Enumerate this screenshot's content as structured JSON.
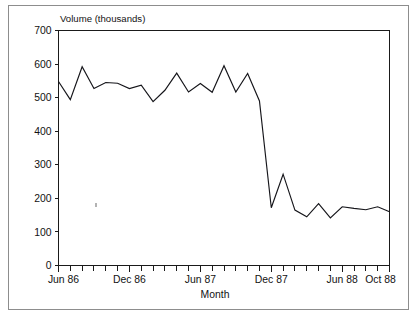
{
  "figure": {
    "background_color": "#ffffff",
    "border_color": "#8d8d8d",
    "line_color": "#15151a"
  },
  "chart_data": {
    "type": "line",
    "title": "",
    "subtitle": "",
    "ylabel": "Volume (thousands)",
    "xlabel": "Month",
    "ylim": [
      0,
      700
    ],
    "ytick_values": [
      0,
      100,
      200,
      300,
      400,
      500,
      600,
      700
    ],
    "ytick_labels": [
      "0",
      "100",
      "200",
      "300",
      "400",
      "500",
      "600",
      "700"
    ],
    "xtick_labels": [
      "Jun 86",
      "Dec 86",
      "Jun 87",
      "Dec 87",
      "Jun 88",
      "Oct 88"
    ],
    "xtick_indices": [
      0,
      6,
      12,
      18,
      24,
      28
    ],
    "grid": false,
    "legend": false,
    "minor_ticks": "monthly",
    "x": [
      "Jun 86",
      "Jul 86",
      "Aug 86",
      "Sep 86",
      "Oct 86",
      "Nov 86",
      "Dec 86",
      "Jan 87",
      "Feb 87",
      "Mar 87",
      "Apr 87",
      "May 87",
      "Jun 87",
      "Jul 87",
      "Aug 87",
      "Sep 87",
      "Oct 87",
      "Nov 87",
      "Dec 87",
      "Jan 88",
      "Feb 88",
      "Mar 88",
      "Apr 88",
      "May 88",
      "Jun 88",
      "Jul 88",
      "Aug 88",
      "Sep 88",
      "Oct 88"
    ],
    "values": [
      548,
      494,
      592,
      527,
      545,
      543,
      527,
      537,
      488,
      522,
      573,
      517,
      542,
      516,
      595,
      517,
      572,
      490,
      172,
      272,
      165,
      145,
      184,
      142,
      175,
      170,
      166,
      175,
      160
    ],
    "series": [
      {
        "name": "Volume",
        "values": [
          548,
          494,
          592,
          527,
          545,
          543,
          527,
          537,
          488,
          522,
          573,
          517,
          542,
          516,
          595,
          517,
          572,
          490,
          172,
          272,
          165,
          145,
          184,
          142,
          175,
          170,
          166,
          175,
          160
        ]
      }
    ],
    "annotations": []
  }
}
